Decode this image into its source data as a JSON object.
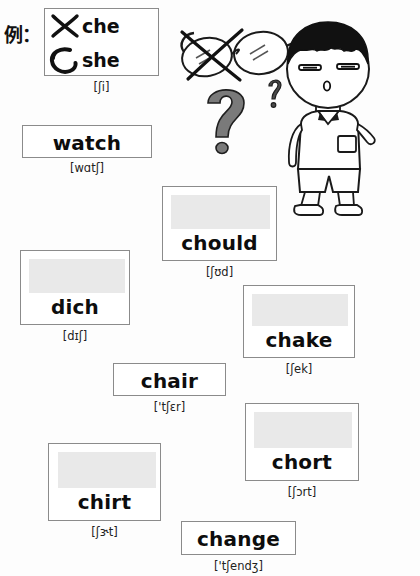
{
  "worksheet": {
    "example_label": "例：",
    "example": {
      "wrong": {
        "mark": "cross-mark",
        "word": "che"
      },
      "right": {
        "mark": "circle-mark",
        "word": "she"
      },
      "phonetic": "[ʃi]"
    },
    "cards": [
      {
        "id": "watch",
        "word": "watch",
        "phonetic": "[wɑtʃ]",
        "has_blank": false,
        "x": 22,
        "y": 125,
        "w": 130,
        "h": 33,
        "phon_x": 22,
        "phon_w": 130,
        "phon_y": 161
      },
      {
        "id": "chould",
        "word": "chould",
        "phonetic": "[ʃʊd]",
        "has_blank": true,
        "x": 162,
        "y": 186,
        "w": 115,
        "h": 75,
        "blank_x": 8,
        "blank_y": 8,
        "blank_w": 99,
        "blank_h": 34,
        "word_y": 44,
        "phon_x": 162,
        "phon_w": 115,
        "phon_y": 265
      },
      {
        "id": "dich",
        "word": "dich",
        "phonetic": "[dɪʃ]",
        "has_blank": true,
        "x": 20,
        "y": 250,
        "w": 110,
        "h": 75,
        "blank_x": 8,
        "blank_y": 8,
        "blank_w": 96,
        "blank_h": 34,
        "word_y": 44,
        "phon_x": 20,
        "phon_w": 110,
        "phon_y": 329
      },
      {
        "id": "chake",
        "word": "chake",
        "phonetic": "[ʃek]",
        "has_blank": true,
        "x": 243,
        "y": 285,
        "w": 112,
        "h": 73,
        "blank_x": 8,
        "blank_y": 8,
        "blank_w": 96,
        "blank_h": 32,
        "word_y": 42,
        "phon_x": 243,
        "phon_w": 112,
        "phon_y": 362
      },
      {
        "id": "chair",
        "word": "chair",
        "phonetic": "['tʃɛr]",
        "has_blank": false,
        "x": 113,
        "y": 363,
        "w": 113,
        "h": 33,
        "phon_x": 113,
        "phon_w": 113,
        "phon_y": 400
      },
      {
        "id": "chort",
        "word": "chort",
        "phonetic": "[ʃɔrt]",
        "has_blank": true,
        "x": 245,
        "y": 403,
        "w": 114,
        "h": 78,
        "blank_x": 8,
        "blank_y": 8,
        "blank_w": 98,
        "blank_h": 36,
        "word_y": 46,
        "phon_x": 245,
        "phon_w": 114,
        "phon_y": 485
      },
      {
        "id": "chirt",
        "word": "chirt",
        "phonetic": "[ʃɝt]",
        "has_blank": true,
        "x": 48,
        "y": 443,
        "w": 113,
        "h": 78,
        "blank_x": 9,
        "blank_y": 8,
        "blank_w": 98,
        "blank_h": 36,
        "word_y": 46,
        "phon_x": 48,
        "phon_w": 113,
        "phon_y": 525
      },
      {
        "id": "change",
        "word": "change",
        "phonetic": "['tʃendʒ]",
        "has_blank": false,
        "x": 181,
        "y": 521,
        "w": 115,
        "h": 34,
        "phon_x": 181,
        "phon_w": 115,
        "phon_y": 559
      }
    ],
    "illustration": {
      "glasses": "eyeglasses-crossed-out",
      "question_marks": [
        "?",
        "?"
      ],
      "character": "confused-boy"
    }
  }
}
